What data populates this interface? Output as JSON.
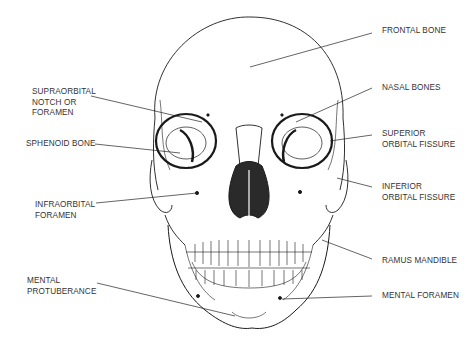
{
  "diagram": {
    "colors": {
      "ink": "#1a1a1a",
      "label": "#333333",
      "background": "#ffffff"
    },
    "labels_left": [
      {
        "id": "supraorbital",
        "lines": [
          "SUPRAORBITAL",
          "NOTCH OR",
          "FORAMEN"
        ]
      },
      {
        "id": "sphenoid",
        "lines": [
          "SPHENOID BONE"
        ]
      },
      {
        "id": "infraorbital",
        "lines": [
          "INFRAORBITAL",
          "FORAMEN"
        ]
      },
      {
        "id": "mental-protuberance",
        "lines": [
          "MENTAL",
          "PROTUBERANCE"
        ]
      }
    ],
    "labels_right": [
      {
        "id": "frontal",
        "lines": [
          "FRONTAL BONE"
        ]
      },
      {
        "id": "nasal",
        "lines": [
          "NASAL BONES"
        ]
      },
      {
        "id": "superior-orbital-fissure",
        "lines": [
          "SUPERIOR",
          "ORBITAL FISSURE"
        ]
      },
      {
        "id": "inferior-orbital-fissure",
        "lines": [
          "INFERIOR",
          "ORBITAL FISSURE"
        ]
      },
      {
        "id": "ramus-mandible",
        "lines": [
          "RAMUS MANDIBLE"
        ]
      },
      {
        "id": "mental-foramen",
        "lines": [
          "MENTAL FORAMEN"
        ]
      }
    ]
  }
}
